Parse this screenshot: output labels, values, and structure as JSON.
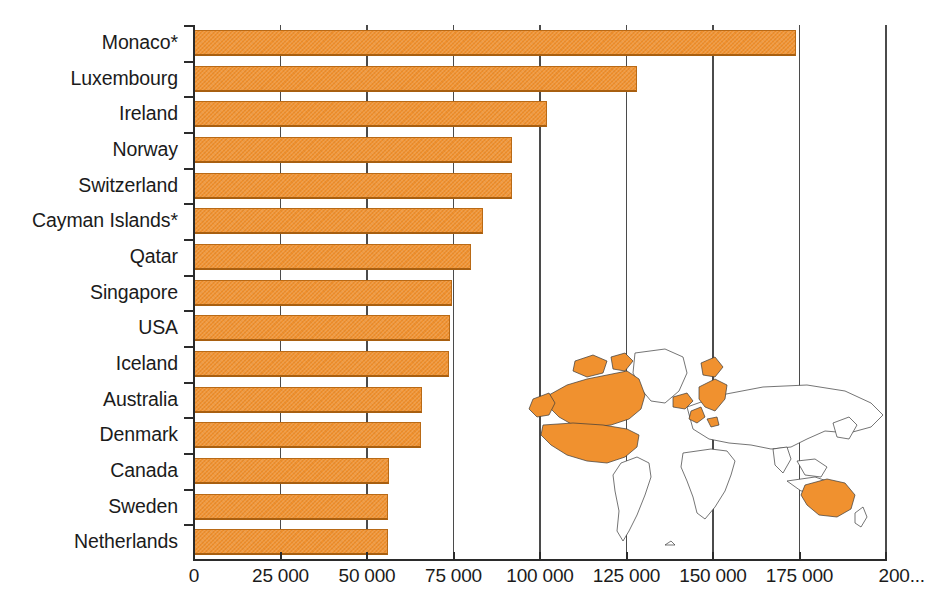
{
  "chart_data": {
    "type": "bar",
    "orientation": "horizontal",
    "title": "",
    "subtitle": "",
    "xlabel": "",
    "ylabel": "",
    "categories": [
      "Monaco*",
      "Luxembourg",
      "Ireland",
      "Norway",
      "Switzerland",
      "Cayman Islands*",
      "Qatar",
      "Singapore",
      "USA",
      "Iceland",
      "Australia",
      "Denmark",
      "Canada",
      "Sweden",
      "Netherlands"
    ],
    "values": [
      174000,
      128000,
      102000,
      92000,
      92000,
      83500,
      80000,
      74500,
      74000,
      73700,
      66000,
      65600,
      56500,
      56000,
      56000
    ],
    "xlim": [
      0,
      200000
    ],
    "xticks": [
      0,
      25000,
      50000,
      75000,
      100000,
      125000,
      150000,
      175000,
      200000
    ],
    "xticklabels": [
      "0",
      "25 000",
      "50 000",
      "75 000",
      "100 000",
      "125 000",
      "150 000",
      "175 000",
      "200..."
    ],
    "grid": "vertical",
    "legend": "none",
    "bar_color": "#f0912f",
    "bar_edge_color": "#b96a16",
    "axis_color": "#2b2b2b",
    "gridline_color": "#4b4b4b",
    "footnote_marker": "*",
    "annotations": [
      "World map inset highlighting listed countries in orange"
    ]
  },
  "map_inset": {
    "name": "world-map-inset",
    "highlight_color": "#f0912f",
    "outline_color": "#3a3a3a",
    "background_color": "#ffffff",
    "highlighted_regions": [
      "USA",
      "Canada",
      "Iceland",
      "Ireland",
      "United Kingdom",
      "Norway",
      "Sweden",
      "Denmark",
      "Netherlands",
      "Switzerland",
      "Luxembourg",
      "Australia"
    ]
  }
}
